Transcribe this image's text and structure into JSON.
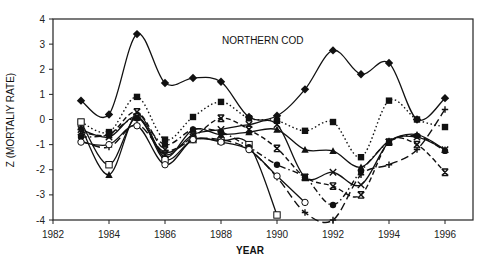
{
  "chart_data": {
    "type": "line",
    "title": "NORTHERN COD",
    "xlabel": "YEAR",
    "ylabel": "Z (MORTALIY RATE)",
    "xlim": [
      1982,
      1997
    ],
    "ylim": [
      -4,
      4
    ],
    "x_ticks": [
      "1982",
      "1984",
      "1986",
      "1988",
      "1990",
      "1992",
      "1994",
      "1996"
    ],
    "y_ticks": [
      "4",
      "3",
      "2",
      "1",
      "0",
      "-1",
      "-2",
      "-3",
      "-4"
    ],
    "grid": false,
    "legend": null,
    "series": [
      {
        "name": "diamond-solid",
        "marker": "diamond-filled",
        "dash": "solid",
        "x": [
          1983,
          1984,
          1985,
          1986,
          1987,
          1988,
          1989,
          1990,
          1991,
          1992,
          1993,
          1994,
          1995,
          1996
        ],
        "values": [
          0.75,
          0.2,
          3.4,
          1.45,
          1.65,
          1.5,
          0.1,
          0.15,
          1.2,
          2.75,
          1.8,
          2.25,
          0.0,
          0.85
        ]
      },
      {
        "name": "filled-square-dotted",
        "marker": "square-filled",
        "dash": "dotted",
        "x": [
          1983,
          1984,
          1985,
          1986,
          1987,
          1988,
          1989,
          1990,
          1991,
          1992,
          1993,
          1994,
          1995,
          1996
        ],
        "values": [
          -0.1,
          -0.5,
          0.9,
          -0.8,
          0.1,
          0.7,
          0.05,
          -0.05,
          -0.45,
          -0.1,
          -1.5,
          0.75,
          0.0,
          -0.3
        ]
      },
      {
        "name": "triangle-solid",
        "marker": "triangle-filled",
        "dash": "solid",
        "x": [
          1983,
          1984,
          1985,
          1986,
          1987,
          1988,
          1989,
          1990,
          1991,
          1992,
          1993,
          1994,
          1995,
          1996
        ],
        "values": [
          -0.3,
          -2.2,
          0.2,
          -1.5,
          -0.4,
          -0.6,
          -0.5,
          -0.4,
          -1.2,
          -1.25,
          -1.9,
          -0.85,
          -0.6,
          -1.2
        ]
      },
      {
        "name": "open-square-solid",
        "marker": "square-open",
        "dash": "solid",
        "x": [
          1983,
          1984,
          1985,
          1986,
          1987,
          1988,
          1989,
          1990
        ],
        "values": [
          -0.1,
          -1.8,
          0.1,
          -1.6,
          -0.8,
          -0.85,
          -1.0,
          -3.8
        ]
      },
      {
        "name": "x-solid",
        "marker": "x",
        "dash": "solid",
        "x": [
          1983,
          1984,
          1985,
          1986,
          1987,
          1988,
          1989,
          1990,
          1991,
          1992,
          1993,
          1994,
          1995,
          1996
        ],
        "values": [
          -0.4,
          -0.7,
          0.1,
          -1.4,
          -0.6,
          -0.4,
          -0.2,
          -0.2,
          -2.3,
          -2.1,
          -2.6,
          -0.9,
          -0.7,
          -1.2
        ]
      },
      {
        "name": "asterisk-dashed",
        "marker": "asterisk",
        "dash": "dashed",
        "x": [
          1983,
          1984,
          1985,
          1986,
          1987,
          1988,
          1989,
          1990,
          1991,
          1992,
          1993,
          1994,
          1995,
          1996
        ],
        "values": [
          -0.5,
          -0.6,
          0.3,
          -1.2,
          -0.7,
          0.05,
          -0.4,
          -1.15,
          -2.3,
          -2.65,
          -3.0,
          -0.9,
          -1.0,
          -2.1
        ]
      },
      {
        "name": "filled-circle-dashdot",
        "marker": "circle-filled",
        "dash": "dashdot",
        "x": [
          1983,
          1984,
          1985,
          1986,
          1987,
          1988,
          1989,
          1990,
          1991,
          1992,
          1993,
          1994,
          1995,
          1996
        ],
        "values": [
          -0.7,
          -0.6,
          0.05,
          -1.0,
          -0.4,
          -0.5,
          -1.1,
          -1.8,
          -2.3,
          -3.4,
          -2.05,
          -0.9,
          -0.65,
          -1.25
        ]
      },
      {
        "name": "plus-dashed",
        "marker": "plus",
        "dash": "longdash",
        "x": [
          1983,
          1984,
          1985,
          1986,
          1987,
          1988,
          1989,
          1990,
          1991,
          1992,
          1993,
          1994,
          1995,
          1996
        ],
        "values": [
          -0.85,
          -1.1,
          -0.2,
          -1.3,
          -0.8,
          -0.8,
          -1.2,
          -2.3,
          -3.7,
          -4.0,
          -2.2,
          -1.8,
          -1.2,
          0.4
        ]
      },
      {
        "name": "open-circle-solid",
        "marker": "circle-open",
        "dash": "solid",
        "x": [
          1983,
          1984,
          1985,
          1986,
          1987,
          1988,
          1989,
          1990,
          1991
        ],
        "values": [
          -0.9,
          -1.0,
          -0.25,
          -1.8,
          -0.8,
          -0.9,
          -1.2,
          -2.25,
          -3.3
        ]
      }
    ]
  }
}
